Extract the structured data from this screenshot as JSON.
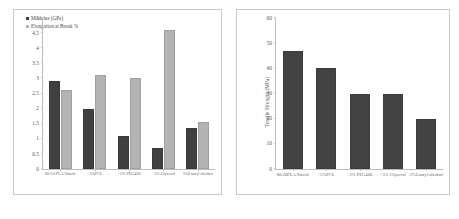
{
  "chart_data": [
    {
      "type": "bar",
      "id": "left",
      "title": "",
      "xlabel": "",
      "ylabel": "",
      "ylim": [
        0,
        5
      ],
      "yticks": [
        0,
        0.5,
        1,
        1.5,
        2,
        2.5,
        3,
        3.5,
        4,
        4.5,
        5
      ],
      "ytick_labels": [
        "0",
        "0.5",
        "1",
        "1.5",
        "2",
        "2.5",
        "3",
        "3.5",
        "4",
        "4.5",
        "5"
      ],
      "grid": false,
      "legend_position": "top-left",
      "categories": [
        "80:20 PLA/Starch",
        "+5%PCL",
        "+5% PEG400",
        "+5% Glycerol",
        "5%Lauryl alcohol"
      ],
      "series": [
        {
          "name": "Modulus (GPa)",
          "color": "#404040",
          "values": [
            2.9,
            2.0,
            1.1,
            0.7,
            1.35
          ]
        },
        {
          "name": "Elongation at Break %",
          "color": "#b3b3b3",
          "values": [
            2.62,
            3.1,
            3.0,
            4.6,
            1.55
          ]
        }
      ]
    },
    {
      "type": "bar",
      "id": "right",
      "title": "",
      "xlabel": "",
      "ylabel": "Tensile Strength (MPa)",
      "ylim": [
        0,
        60
      ],
      "yticks": [
        0,
        10,
        20,
        30,
        40,
        50,
        60
      ],
      "ytick_labels": [
        "0",
        "10",
        "20",
        "30",
        "40",
        "50",
        "60"
      ],
      "grid": false,
      "legend_position": "none",
      "categories": [
        "80:20PLA/Starch",
        "+5%PCL",
        "+5% PEG400",
        "+5% Glycerol",
        "5%Lauryl alcohol"
      ],
      "series": [
        {
          "name": "Tensile Strength (MPa)",
          "color": "#434343",
          "values": [
            47,
            40,
            30,
            30,
            20
          ]
        }
      ]
    }
  ]
}
